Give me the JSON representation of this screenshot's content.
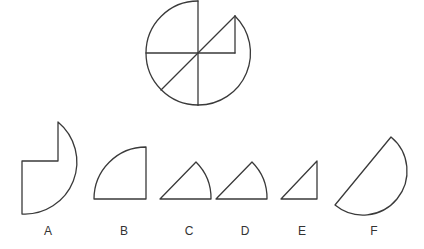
{
  "puzzle": {
    "figure": {
      "description": "circle divided by vertical, horizontal and diagonal lines with a right-triangle cutout region in the upper-right"
    },
    "options": [
      {
        "label": "A"
      },
      {
        "label": "B"
      },
      {
        "label": "C"
      },
      {
        "label": "D"
      },
      {
        "label": "E"
      },
      {
        "label": "F"
      }
    ],
    "colors": {
      "stroke": "#3a3a3a",
      "background": "#ffffff",
      "label": "#333333"
    }
  }
}
